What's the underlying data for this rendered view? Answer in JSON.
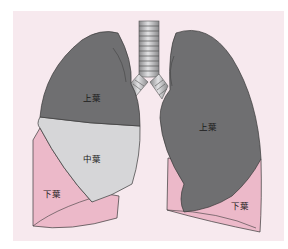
{
  "diagram": {
    "type": "anatomical-illustration",
    "colors": {
      "background": "#f7e9ee",
      "upper_lobe": "#6f6f71",
      "middle_lobe": "#d6d6d8",
      "lower_lobe": "#ecb9c9",
      "outline": "#3a3a3a"
    },
    "labels": {
      "right_upper": "上葉",
      "right_middle": "中葉",
      "right_lower": "下葉",
      "left_upper": "上葉",
      "left_lower": "下葉"
    }
  }
}
